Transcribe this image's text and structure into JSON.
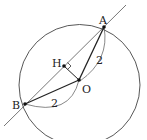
{
  "diagram": {
    "points": [
      {
        "id": "A",
        "label": "A"
      },
      {
        "id": "B",
        "label": "B"
      },
      {
        "id": "O",
        "label": "O"
      },
      {
        "id": "H",
        "label": "H"
      }
    ],
    "lengths": {
      "OA": "2",
      "OB": "2"
    },
    "colors": {
      "stroke": "#333333",
      "line": "#555555"
    }
  }
}
